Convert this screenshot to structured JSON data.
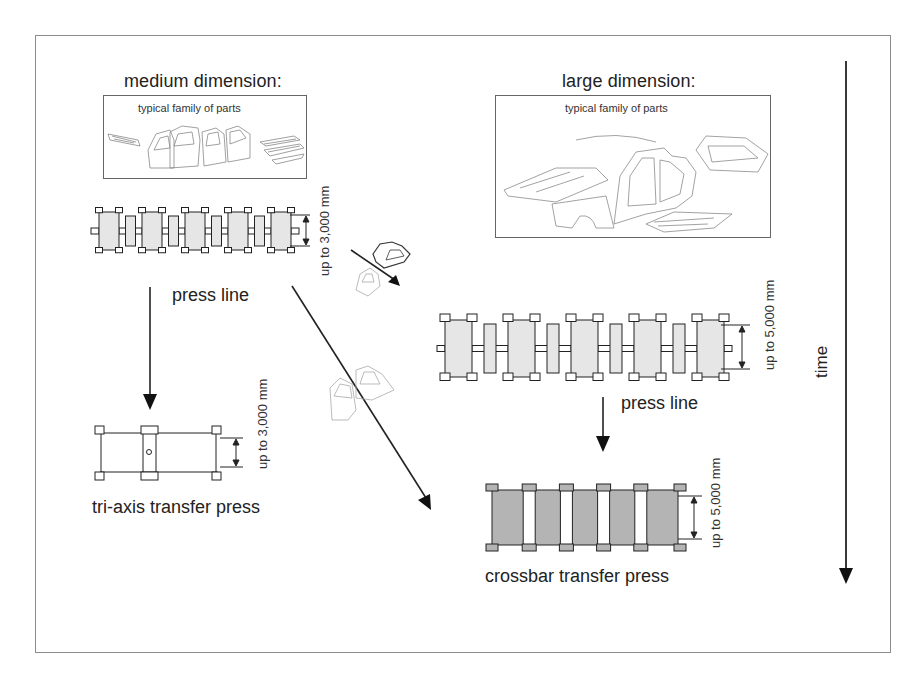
{
  "diagram": {
    "medium": {
      "heading": "medium dimension:",
      "parts_caption": "typical family of parts",
      "press_line_label": "press line",
      "press_line_dimension": "up to 3,000 mm",
      "transfer_press_label": "tri-axis transfer press",
      "transfer_press_dimension": "up to 3,000 mm",
      "press_line_stations": 5
    },
    "large": {
      "heading": "large dimension:",
      "parts_caption": "typical family of parts",
      "press_line_label": "press line",
      "press_line_dimension": "up to 5,000 mm",
      "transfer_press_label": "crossbar transfer press",
      "transfer_press_dimension": "up to 5,000 mm",
      "press_line_stations": 5,
      "crossbar_stations": 5
    },
    "time_axis_label": "time",
    "colors": {
      "line": "#222222",
      "press_fill_light": "#e6e6e6",
      "press_fill_dark": "#b4b4b4",
      "frame": "#8c8c8c"
    }
  }
}
